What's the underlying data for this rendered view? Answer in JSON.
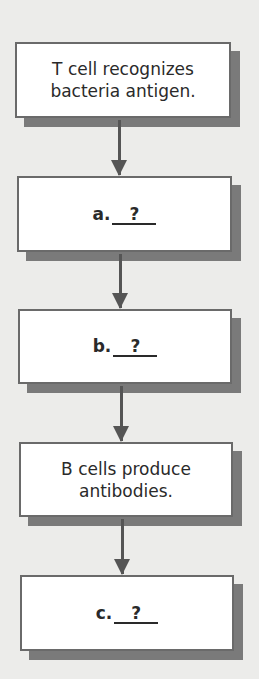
{
  "flowchart": {
    "steps": [
      {
        "id": "step-1",
        "type": "text",
        "line1": "T cell recognizes",
        "line2": "bacteria antigen."
      },
      {
        "id": "step-a",
        "type": "blank",
        "label": "a.",
        "answer": "?"
      },
      {
        "id": "step-b",
        "type": "blank",
        "label": "b.",
        "answer": "?"
      },
      {
        "id": "step-4",
        "type": "text",
        "line1": "B cells produce",
        "line2": "antibodies."
      },
      {
        "id": "step-c",
        "type": "blank",
        "label": "c.",
        "answer": "?"
      }
    ],
    "colors": {
      "background": "#ececea",
      "box_fill": "#ffffff",
      "box_border": "#6a6a6a",
      "shadow": "#7a7a7a",
      "arrow": "#555555",
      "text": "#2a2a2a"
    }
  }
}
